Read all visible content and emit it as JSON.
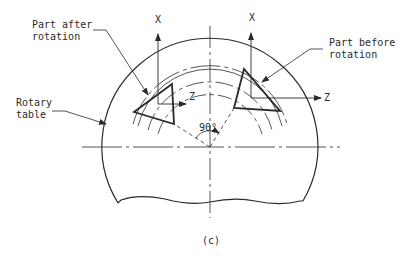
{
  "figure": {
    "caption": "(c)",
    "labels": {
      "part_after_line1": "Part after",
      "part_after_line2": "rotation",
      "part_before_line1": "Part before",
      "part_before_line2": "rotation",
      "rotary_table_line1": "Rotary",
      "rotary_table_line2": "table",
      "angle": "90°"
    },
    "axes": {
      "left_x": "X",
      "left_z": "Z",
      "right_x": "X",
      "right_z": "Z"
    },
    "colors": {
      "line": "#2a2a2a",
      "background": "#ffffff"
    }
  }
}
